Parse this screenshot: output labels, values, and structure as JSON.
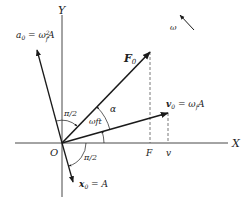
{
  "diagram": {
    "type": "phasor-diagram",
    "origin": {
      "label": "O",
      "x": 62,
      "y": 143
    },
    "axes": {
      "x": {
        "label": "X",
        "from": [
          15,
          143
        ],
        "to": [
          228,
          143
        ]
      },
      "y": {
        "label": "Y",
        "from": [
          62,
          197
        ],
        "to": [
          62,
          15
        ]
      }
    },
    "vectors": [
      {
        "id": "F0",
        "label_main": "F",
        "label_sub": "0",
        "bold": true,
        "to": [
          150,
          52
        ]
      },
      {
        "id": "v0",
        "label_main": "v",
        "label_sub": "0",
        "label_rest": " = ω",
        "label_rest_sub": "f",
        "label_tail": "A",
        "to": [
          168,
          113
        ]
      },
      {
        "id": "a0",
        "label_main": "a",
        "label_sub": "0",
        "label_rest": " = ω",
        "label_rest_sup": "2",
        "label_rest_sub": "f",
        "label_tail": "A",
        "to": [
          37,
          50
        ]
      },
      {
        "id": "x0",
        "label_main": "x",
        "label_sub": "0",
        "label_rest": " = A",
        "to": [
          73,
          182
        ]
      }
    ],
    "projections": [
      {
        "label": "F",
        "x": 150,
        "from_y": 52
      },
      {
        "label": "v",
        "x": 168,
        "from_y": 113
      }
    ],
    "angles": [
      {
        "label": "π/2",
        "between": "a0-F0"
      },
      {
        "label": "ωft",
        "between": "X-v0"
      },
      {
        "label": "α",
        "between": "v0-F0"
      },
      {
        "label": "π/2",
        "between": "x0-X"
      }
    ],
    "rotation": {
      "label": "ω",
      "from": [
        194,
        30
      ],
      "to": [
        180,
        15
      ]
    },
    "colors": {
      "stroke": "#1a1a1a",
      "dash": "#555555",
      "background": "#ffffff"
    }
  }
}
